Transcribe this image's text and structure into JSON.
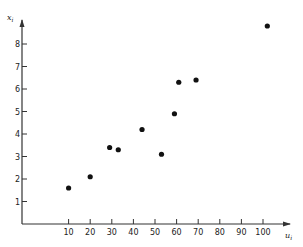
{
  "chart_data": {
    "type": "scatter",
    "title": "",
    "xlabel": "u_i",
    "ylabel": "x_i",
    "xlabel_display": "u",
    "xlabel_sub": "i",
    "ylabel_display": "x",
    "ylabel_sub": "i",
    "xlim": [
      -12,
      110
    ],
    "ylim": [
      0,
      9
    ],
    "grid": false,
    "legend": null,
    "x_ticks": [
      10,
      20,
      30,
      40,
      50,
      60,
      70,
      80,
      90,
      100
    ],
    "y_ticks": [
      1,
      2,
      3,
      4,
      5,
      6,
      7,
      8
    ],
    "points": [
      {
        "x": 10,
        "y": 1.6
      },
      {
        "x": 20,
        "y": 2.1
      },
      {
        "x": 29,
        "y": 3.4
      },
      {
        "x": 33,
        "y": 3.3
      },
      {
        "x": 44,
        "y": 4.2
      },
      {
        "x": 53,
        "y": 3.1
      },
      {
        "x": 59,
        "y": 4.9
      },
      {
        "x": 61,
        "y": 6.3
      },
      {
        "x": 69,
        "y": 6.4
      },
      {
        "x": 102,
        "y": 8.8
      }
    ],
    "marker_color": "#111111",
    "axis_color": "#333333"
  }
}
